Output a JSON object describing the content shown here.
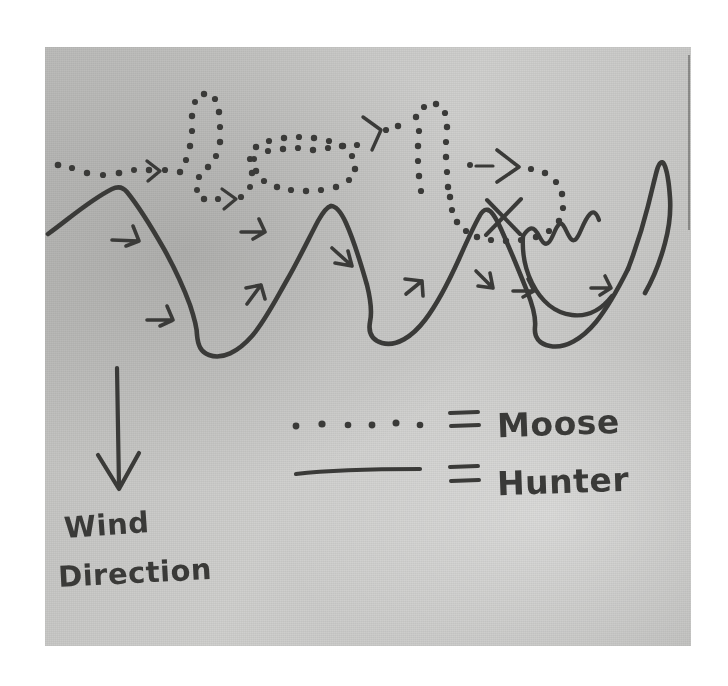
{
  "image": {
    "kind": "photograph-of-hand-drawn-diagram",
    "medium": "pencil on gray paper",
    "background_color": "#ffffff",
    "paper_color": "#c9c9c7",
    "ink_color": "#3a3a38"
  },
  "annotations": {
    "wind": {
      "icon": "down-arrow-icon",
      "line1": "Wind",
      "line2": "Direction"
    }
  },
  "legend": {
    "items": [
      {
        "swatch": "dotted-line-swatch",
        "equals": "=",
        "label": "Moose",
        "style": "dotted",
        "dot_count": 6
      },
      {
        "swatch": "solid-line-swatch",
        "equals": "=",
        "label": "Hunter",
        "style": "solid"
      }
    ]
  },
  "diagram": {
    "title_text": "",
    "paths": [
      {
        "name": "hunter-path",
        "style": "solid",
        "description": "zig-zag stalking track crossing back and forth beneath the moose trail",
        "arrow_count": 9
      },
      {
        "name": "moose-path",
        "style": "dotted",
        "description": "wandering browse trail along the top of the sheet",
        "arrow_count": 4
      }
    ],
    "marks": [
      {
        "name": "x-mark",
        "description": "crossing point where the two tracks intersect"
      }
    ]
  }
}
